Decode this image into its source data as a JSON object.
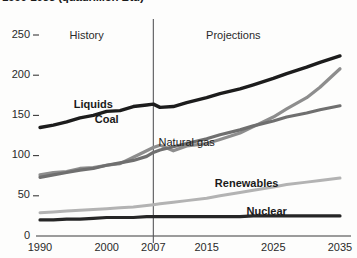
{
  "chart_data": {
    "type": "line",
    "title": "1990-2035 (quadrillion Btu)",
    "xlabel": "",
    "ylabel": "",
    "xlim": [
      1990,
      2035
    ],
    "ylim": [
      0,
      250
    ],
    "ytick_labels": [
      "0",
      "50",
      "100",
      "150",
      "200",
      "250"
    ],
    "yticks": [
      0,
      50,
      100,
      150,
      200,
      250
    ],
    "xtick_labels": [
      "1990",
      "2000",
      "2007",
      "2015",
      "2025",
      "2035"
    ],
    "xticks": [
      1990,
      2000,
      2007,
      2015,
      2025,
      2035
    ],
    "grid": false,
    "legend_position": "inline-annotations",
    "annotations": [
      {
        "text": "History",
        "x": 1997,
        "y": 248
      },
      {
        "text": "Projections",
        "x": 2019,
        "y": 248
      },
      {
        "text": "divider",
        "x": 2007
      }
    ],
    "divider_year": 2007,
    "x": [
      1990,
      1992,
      1994,
      1996,
      1998,
      2000,
      2002,
      2004,
      2006,
      2007,
      2008,
      2010,
      2012,
      2015,
      2017,
      2020,
      2022,
      2025,
      2027,
      2030,
      2032,
      2035
    ],
    "series": [
      {
        "name": "Liquids",
        "color": "#1c1c1c",
        "width": 3.4,
        "label_x": 1998,
        "label_y": 162,
        "values": [
          135,
          138,
          142,
          147,
          150,
          155,
          156,
          161,
          163,
          164,
          160,
          161,
          166,
          172,
          177,
          183,
          188,
          196,
          202,
          210,
          216,
          224
        ]
      },
      {
        "name": "Coal",
        "color": "#8d8d8d",
        "width": 3.2,
        "label_x": 2000,
        "label_y": 143,
        "values": [
          76,
          79,
          80,
          84,
          85,
          88,
          90,
          98,
          106,
          110,
          113,
          106,
          112,
          115,
          120,
          128,
          136,
          148,
          158,
          172,
          185,
          208
        ]
      },
      {
        "name": "Natural gas",
        "color": "#6f6f6f",
        "width": 3.2,
        "label_x": 2012,
        "label_y": 114,
        "values": [
          73,
          76,
          79,
          82,
          84,
          88,
          91,
          94,
          99,
          104,
          107,
          111,
          115,
          121,
          126,
          132,
          137,
          143,
          148,
          153,
          157,
          162
        ]
      },
      {
        "name": "Renewables",
        "color": "#b3b3b3",
        "width": 3.0,
        "label_x": 2021,
        "label_y": 63,
        "values": [
          29,
          30,
          31,
          32,
          33,
          34,
          35,
          36,
          38,
          39,
          40,
          42,
          44,
          47,
          50,
          54,
          57,
          61,
          64,
          67,
          69,
          72
        ]
      },
      {
        "name": "Nuclear",
        "color": "#262626",
        "width": 3.2,
        "label_x": 2024,
        "label_y": 29,
        "values": [
          20,
          20,
          21,
          21,
          22,
          23,
          23,
          23,
          24,
          24,
          24,
          24,
          24,
          24,
          24,
          24,
          25,
          25,
          25,
          25,
          25,
          25
        ]
      }
    ]
  }
}
